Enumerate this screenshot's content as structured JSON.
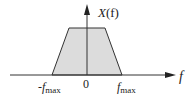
{
  "diagram": {
    "type": "spectrum-plot",
    "shape": "trapezoid",
    "y_axis_label": {
      "name": "X",
      "arg": "(f)"
    },
    "x_axis_label": "f",
    "ticks": {
      "neg_fmax": {
        "sign": "-",
        "f": "f",
        "sub": "max"
      },
      "zero": "0",
      "pos_fmax": {
        "f": "f",
        "sub": "max"
      }
    },
    "colors": {
      "fill": "#dcdcdc",
      "stroke": "#333333",
      "axis": "#333333",
      "background": "#ffffff"
    }
  }
}
